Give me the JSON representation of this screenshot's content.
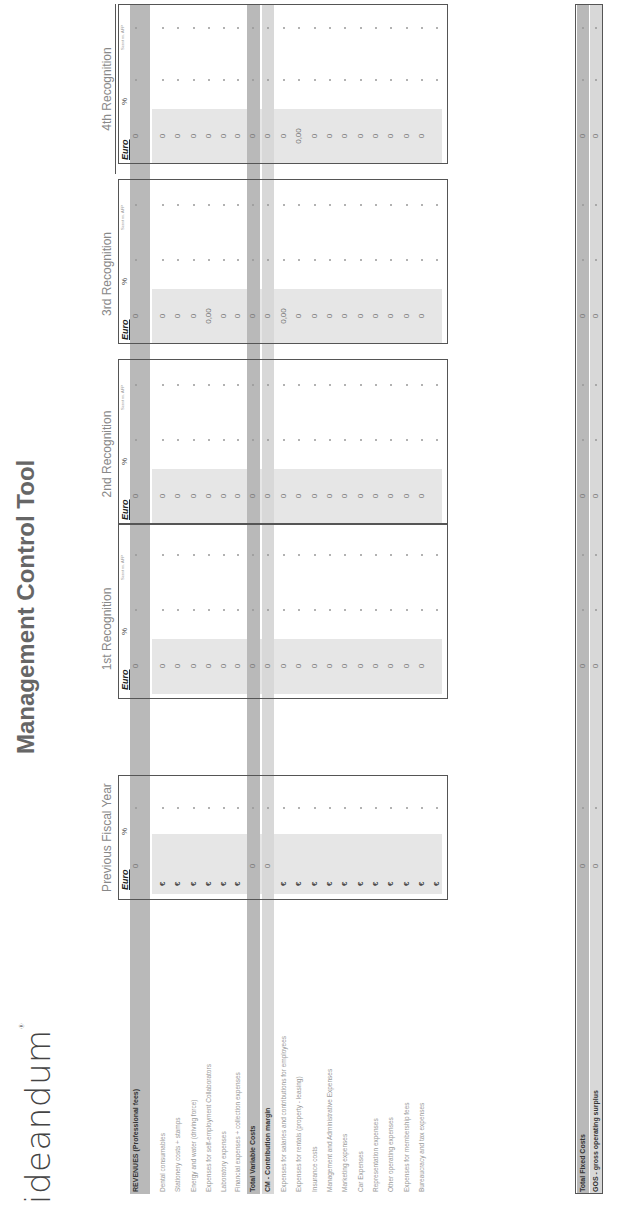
{
  "brand": {
    "logo": "ideandum",
    "trademark": "®"
  },
  "title": "Management Control Tool",
  "column_groups": [
    {
      "label": "Previous Fiscal Year",
      "subcols": [
        "Euro",
        "%"
      ]
    },
    {
      "label": "1st Recognition",
      "subcols": [
        "Euro",
        "%",
        "Scost vs. AFP"
      ]
    },
    {
      "label": "2nd Recognition",
      "subcols": [
        "Euro",
        "%",
        "Scost vs. AFP"
      ]
    },
    {
      "label": "3rd Recognition",
      "subcols": [
        "Euro",
        "%",
        "Scost vs. AFP"
      ]
    },
    {
      "label": "4th Recognition",
      "subcols": [
        "Euro",
        "%",
        "Scost vs. AFP"
      ]
    }
  ],
  "rows": [
    {
      "label": "REVENUES (Professional fees)",
      "type": "total-dark",
      "prev": "0",
      "r1": "0",
      "r2": "0",
      "r3": "0",
      "r4": "0"
    },
    {
      "label": "Dental consumables",
      "type": "item",
      "prev": "€",
      "r1": "0",
      "r2": "0",
      "r3": "0",
      "r4": "0"
    },
    {
      "label": "Stationery costs + stamps",
      "type": "item",
      "prev": "€",
      "r1": "0",
      "r2": "0",
      "r3": "0",
      "r4": "0"
    },
    {
      "label": "Energy and water (driving force)",
      "type": "item",
      "prev": "€",
      "r1": "0",
      "r2": "0",
      "r3": "0",
      "r4": "0"
    },
    {
      "label": "Expenses for self-employment Collaborators",
      "type": "item",
      "prev": "€",
      "r1": "0",
      "r2": "0",
      "r3": "0,00",
      "r4": "0"
    },
    {
      "label": "Laboratory expenses",
      "type": "item",
      "prev": "€",
      "r1": "0",
      "r2": "0",
      "r3": "0",
      "r4": "0"
    },
    {
      "label": "Financial expenses + collection expenses",
      "type": "item",
      "prev": "€",
      "r1": "0",
      "r2": "0",
      "r3": "0",
      "r4": "0"
    },
    {
      "label": "Total Variable Costs",
      "type": "total-dark",
      "prev": "0",
      "r1": "0",
      "r2": "0",
      "r3": "0",
      "r4": "0"
    },
    {
      "label": "CM - Contribution margin",
      "type": "total-light",
      "prev": "0",
      "r1": "0",
      "r2": "0",
      "r3": "0",
      "r4": "0"
    },
    {
      "label": "Expenses for salaries and contributions for employees",
      "type": "item",
      "prev": "€",
      "r1": "0",
      "r2": "0",
      "r3": "0,00",
      "r4": "0"
    },
    {
      "label": "Expenses for rentals (property - leasing)",
      "type": "item",
      "prev": "€",
      "r1": "0",
      "r2": "0",
      "r3": "0",
      "r4": "0,00"
    },
    {
      "label": "Insurance costs",
      "type": "item",
      "prev": "€",
      "r1": "0",
      "r2": "0",
      "r3": "0",
      "r4": "0"
    },
    {
      "label": "Management and Administrative Expenses",
      "type": "item",
      "prev": "€",
      "r1": "0",
      "r2": "0",
      "r3": "0",
      "r4": "0"
    },
    {
      "label": "Marketing expenses",
      "type": "item",
      "prev": "€",
      "r1": "0",
      "r2": "0",
      "r3": "0",
      "r4": "0"
    },
    {
      "label": "Car Expenses",
      "type": "item",
      "prev": "€",
      "r1": "0",
      "r2": "0",
      "r3": "0",
      "r4": "0"
    },
    {
      "label": "Representation expenses",
      "type": "item",
      "prev": "€",
      "r1": "0",
      "r2": "0",
      "r3": "0",
      "r4": "0"
    },
    {
      "label": "Other operating expenses",
      "type": "item",
      "prev": "€",
      "r1": "0",
      "r2": "0",
      "r3": "0",
      "r4": "0"
    },
    {
      "label": "Expenses for membership fees",
      "type": "item",
      "prev": "€",
      "r1": "0",
      "r2": "0",
      "r3": "0",
      "r4": "0"
    },
    {
      "label": "Bureaucracy and tax expenses",
      "type": "item",
      "prev": "€",
      "r1": "0",
      "r2": "0",
      "r3": "0",
      "r4": "0"
    },
    {
      "label": "",
      "type": "item",
      "prev": "€",
      "r1": "",
      "r2": "",
      "r3": "",
      "r4": ""
    },
    {
      "label": "Total Fixed Costs",
      "type": "total-dark",
      "prev": "0",
      "r1": "0",
      "r2": "0",
      "r3": "0",
      "r4": "0"
    },
    {
      "label": "GOS - gross operating surplus",
      "type": "total-light",
      "prev": "0",
      "r1": "0",
      "r2": "0",
      "r3": "0",
      "r4": "0"
    }
  ],
  "colors": {
    "dark_band": "#b9b9b9",
    "light_band": "#d8d8d8",
    "input_area": "#e6e6e6",
    "border": "#555555",
    "text": "#999999"
  }
}
